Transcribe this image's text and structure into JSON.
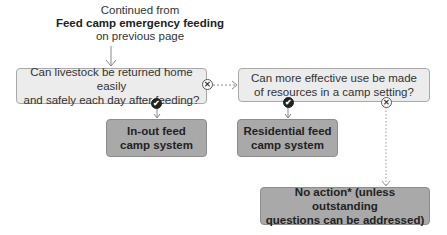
{
  "intro": {
    "line1": "Continued from",
    "line2": "Feed camp emergency feeding",
    "line3": "on previous page"
  },
  "questions": [
    {
      "id": "q1",
      "line1": "Can livestock be returned home easily",
      "line2": "and safely each day after feeding?"
    },
    {
      "id": "q2",
      "line1": "Can more effective use be made",
      "line2": "of resources in a camp setting?"
    }
  ],
  "results": [
    {
      "id": "in-out",
      "line1": "In-out feed",
      "line2": "camp system"
    },
    {
      "id": "residential",
      "line1": "Residential feed",
      "line2": "camp system"
    },
    {
      "id": "no-action",
      "line1": "No action* (unless outstanding",
      "line2": "questions can be addressed)"
    }
  ],
  "icons": {
    "yes": "✔",
    "no": "✕"
  },
  "colors": {
    "question_fill": "#ececec",
    "result_fill": "#a9a9a9",
    "border": "#a9a9a9",
    "line": "#888888"
  }
}
